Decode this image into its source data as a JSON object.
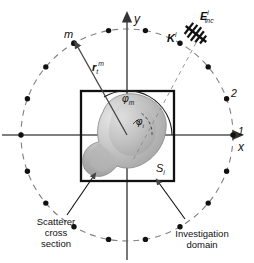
{
  "figure": {
    "background_color": "#ffffff",
    "ink_color": "#111111"
  },
  "axes": {
    "x_label": "x",
    "y_label": "y",
    "origin": {
      "x": 127,
      "y": 135
    },
    "x_axis": {
      "x1": 2,
      "y1": 135,
      "x2": 241,
      "y2": 135
    },
    "y_axis": {
      "x1": 127,
      "y1": 260,
      "x2": 127,
      "y2": 14
    },
    "color": "#555555"
  },
  "investigation_domain": {
    "label": "S",
    "label_sub": "i",
    "square": {
      "x": 81,
      "y": 91,
      "width": 93,
      "height": 90
    },
    "stroke_color": "#111111",
    "stroke_width": 2.2
  },
  "measurement_circle": {
    "center": {
      "x": 127,
      "y": 135
    },
    "radius": 106,
    "dashed": true,
    "stroke_color": "#777777"
  },
  "antenna_positions": {
    "count": 18,
    "dot_radius": 2.7,
    "dot_color": "#111111",
    "angles_deg": [
      0,
      20,
      40,
      60,
      80,
      100,
      120,
      140,
      160,
      180,
      200,
      220,
      240,
      260,
      280,
      300,
      320,
      340
    ],
    "numbered": [
      {
        "label": "1",
        "angle_deg": 0
      },
      {
        "label": "2",
        "angle_deg": 20
      }
    ],
    "source_marker": {
      "label": "m",
      "angle_deg": 122
    }
  },
  "incident_field": {
    "k_label": "K",
    "k_sup": "i",
    "e_label": "E",
    "e_sup": "i",
    "e_sub": "inc",
    "antenna_icon": "hatched-arrow-icon"
  },
  "position_vector": {
    "label": "r",
    "sub": "t",
    "sup": "m",
    "from": {
      "x": 127,
      "y": 135
    },
    "to": {
      "x": 84,
      "y": 48
    }
  },
  "angles": {
    "phi_m": {
      "symbol": "φ",
      "sub": "m"
    },
    "phi": {
      "symbol": "φ",
      "sub": "i"
    }
  },
  "scatterer": {
    "fill_light": "#e2e2e2",
    "fill_mid": "#b9b9b9",
    "fill_dark": "#9a9a9a",
    "stroke": "#8c8c8c"
  },
  "captions": {
    "scatterer": "Scatterer\ncross\nsection",
    "investigation": "Investigation\ndomain"
  },
  "leader_lines": {
    "scatterer_leader": {
      "x1": 67,
      "y1": 215,
      "x2": 93,
      "y2": 177
    },
    "investigation_leader": {
      "x1": 185,
      "y1": 219,
      "x2": 158,
      "y2": 183
    }
  }
}
